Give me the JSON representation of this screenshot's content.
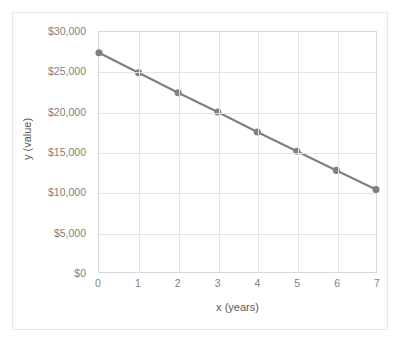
{
  "chart_data": {
    "type": "line",
    "title": "",
    "xlabel": "x (years)",
    "ylabel": "y (value)",
    "x": [
      0,
      1,
      2,
      3,
      4,
      5,
      6,
      7
    ],
    "values": [
      27400,
      24900,
      22400,
      20000,
      17500,
      15100,
      12700,
      10300
    ],
    "series": [
      {
        "name": "value",
        "values": [
          27400,
          24900,
          22400,
          20000,
          17500,
          15100,
          12700,
          10300
        ]
      }
    ],
    "xlim": [
      0,
      7
    ],
    "ylim": [
      0,
      30000
    ],
    "xticks": [
      "0",
      "1",
      "2",
      "3",
      "4",
      "5",
      "6",
      "7"
    ],
    "yticks": [
      "$0",
      "$5,000",
      "$10,000",
      "$15,000",
      "$20,000",
      "$25,000",
      "$30,000"
    ],
    "ytick_values": [
      0,
      5000,
      10000,
      15000,
      20000,
      25000,
      30000
    ],
    "grid": true,
    "grid_horizontal": true,
    "grid_vertical": true,
    "legend": false,
    "legend_position": "none",
    "markers": true,
    "marker_shape": "circle",
    "line_color": "#808080",
    "marker_color": "#808080",
    "grid_color": "#e3e3e3",
    "axis_color": "#d9d9d9",
    "tick_label_color": "#808080",
    "axis_title_color": "#595959",
    "plot_background": "#ffffff"
  }
}
